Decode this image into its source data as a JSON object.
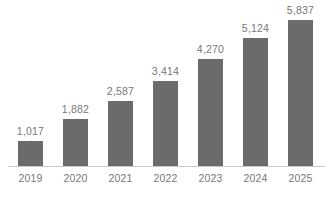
{
  "chart_data": {
    "type": "bar",
    "title": "",
    "subtitle": "",
    "xlabel": "",
    "ylabel": "",
    "categories": [
      "2019",
      "2020",
      "2021",
      "2022",
      "2023",
      "2024",
      "2025"
    ],
    "values": [
      1017,
      1882,
      2587,
      3414,
      4270,
      5124,
      5837
    ],
    "value_labels": [
      "1,017",
      "1,882",
      "2,587",
      "3,414",
      "4,270",
      "5,124",
      "5,837"
    ],
    "ylim": [
      0,
      5837
    ],
    "grid": false,
    "legend": false,
    "legend_position": "none",
    "y_axis_visible": false,
    "x_axis_visible": true,
    "data_labels_position": "above-bar",
    "colors": {
      "bar_fill": "#6b6b6b",
      "label_text": "#777777",
      "tick_text": "#777777",
      "axis_line": "#c9c9c9",
      "background": "#ffffff"
    }
  }
}
